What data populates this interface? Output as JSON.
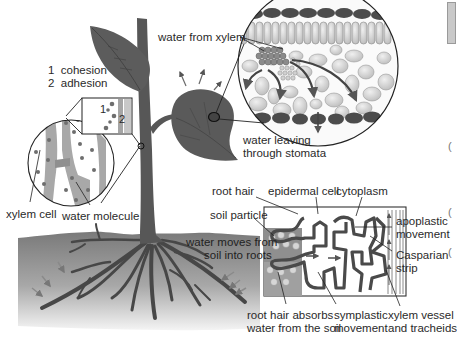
{
  "figure": {
    "colors": {
      "plant": "#5a5a5a",
      "plant_dark": "#444444",
      "soil_top": "#7d7d7d",
      "soil_bottom": "#f2f2f2",
      "cell_fill": "#d9d9d9",
      "cell_wall": "#4a4a4a",
      "xylem_wall": "#a5a5a5",
      "water_dot": "#6e6e6e",
      "arrow": "#6a6a6a"
    }
  },
  "labels": {
    "cohesion_adhesion": {
      "item1_num": "1",
      "item1_text": "cohesion",
      "item2_num": "2",
      "item2_text": "adhesion"
    },
    "inset_numbers": {
      "n1": "1",
      "n2": "2"
    },
    "xylem_cell": "xylem cell",
    "water_molecule": "water molecule",
    "water_from_xylem": "water from xylem",
    "water_leaving_line1": "water leaving",
    "water_leaving_line2": "through stomata",
    "root_hair": "root hair",
    "epidermal_cell": "epidermal cell",
    "cytoplasm": "cytoplasm",
    "soil_particle": "soil particle",
    "water_moves_line1": "water moves from",
    "water_moves_line2": "soil into roots",
    "apoplastic_line1": "apoplastic",
    "apoplastic_line2": "movement",
    "casparian_line1": "Casparian",
    "casparian_line2": "strip",
    "root_hair_absorbs_line1": "root hair absorbs",
    "root_hair_absorbs_line2": "water from the soil",
    "symplastic_line1": "symplastic",
    "symplastic_line2": "movement",
    "xylem_vessel_line1": "xylem vessel",
    "xylem_vessel_line2": "and tracheids"
  },
  "edge_fragments": {
    "marks": [
      "(",
      "(",
      "("
    ]
  }
}
